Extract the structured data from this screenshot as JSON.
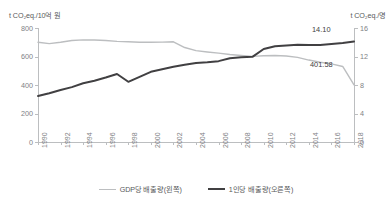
{
  "chart_data": {
    "type": "line",
    "title": "",
    "xlabel": "",
    "grid": false,
    "legend_position": "bottom-center",
    "x": [
      1990,
      1991,
      1992,
      1993,
      1994,
      1995,
      1996,
      1997,
      1998,
      1999,
      2000,
      2001,
      2002,
      2003,
      2004,
      2005,
      2006,
      2007,
      2008,
      2009,
      2010,
      2011,
      2012,
      2013,
      2014,
      2015,
      2016,
      2017,
      2018
    ],
    "xticks": [
      "1990",
      "1992",
      "1994",
      "1996",
      "1998",
      "2000",
      "2002",
      "2004",
      "2006",
      "2008",
      "2010",
      "2012",
      "2014",
      "2016",
      "2018"
    ],
    "axes": {
      "left": {
        "title": "t CO₂eq./10억 원",
        "ticks": [
          0,
          200,
          400,
          600,
          800
        ],
        "ylim": [
          0,
          800
        ],
        "color": "#bcbec0"
      },
      "right": {
        "title": "t CO₂eq./명",
        "ticks": [
          0,
          4,
          8,
          12,
          16
        ],
        "ylim": [
          0,
          16
        ],
        "color": "#414042"
      }
    },
    "series": [
      {
        "name": "GDP당 배출량(왼쪽)",
        "axis": "left",
        "color": "#bcbec0",
        "values": [
          700,
          690,
          700,
          712,
          717,
          716,
          712,
          706,
          703,
          700,
          700,
          701,
          703,
          663,
          641,
          632,
          624,
          614,
          607,
          601,
          605,
          607,
          603,
          594,
          575,
          560,
          548,
          530,
          401.58
        ],
        "end_label": "401.58"
      },
      {
        "name": "1인당 배출량(오른쪽)",
        "axis": "right",
        "color": "#414042",
        "values": [
          6.45,
          6.85,
          7.3,
          7.7,
          8.25,
          8.6,
          9.05,
          9.55,
          8.45,
          9.15,
          9.85,
          10.2,
          10.55,
          10.85,
          11.1,
          11.2,
          11.35,
          11.75,
          11.9,
          11.95,
          13.05,
          13.45,
          13.55,
          13.65,
          13.6,
          13.6,
          13.75,
          13.9,
          14.1
        ],
        "end_label": "14.10"
      }
    ]
  },
  "legend": {
    "items": [
      {
        "label": "GDP당 배출량(왼쪽)",
        "swatch": "light"
      },
      {
        "label": "1인당 배출량(오른쪽)",
        "swatch": "dark"
      }
    ]
  }
}
